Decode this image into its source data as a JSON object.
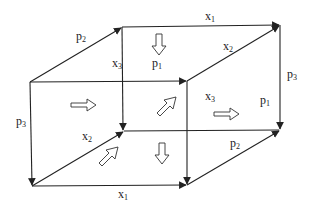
{
  "diagram": {
    "type": "cube-lattice",
    "colors": {
      "stroke": "#222222",
      "background": "#ffffff"
    },
    "vertices": {
      "back_top_left": [
        122,
        27
      ],
      "back_top_right": [
        280,
        25
      ],
      "front_top_left": [
        30,
        82
      ],
      "front_top_right": [
        187,
        81
      ],
      "back_bottom_left": [
        124,
        131
      ],
      "back_bottom_right": [
        280,
        130
      ],
      "front_bottom_left": [
        32,
        186
      ],
      "front_bottom_right": [
        187,
        185
      ]
    },
    "labels": [
      {
        "id": "p2_top",
        "base": "p",
        "sub": "2",
        "x": 76,
        "y": 30
      },
      {
        "id": "x1_top",
        "base": "x",
        "sub": "1",
        "x": 205,
        "y": 10
      },
      {
        "id": "x3_back",
        "base": "x",
        "sub": "3",
        "x": 112,
        "y": 57
      },
      {
        "id": "p1_top",
        "base": "p",
        "sub": "1",
        "x": 152,
        "y": 57
      },
      {
        "id": "x2_top",
        "base": "x",
        "sub": "2",
        "x": 223,
        "y": 40
      },
      {
        "id": "p3_right",
        "base": "p",
        "sub": "3",
        "x": 287,
        "y": 68
      },
      {
        "id": "p3_left",
        "base": "p",
        "sub": "3",
        "x": 16,
        "y": 115
      },
      {
        "id": "x2_mid",
        "base": "x",
        "sub": "2",
        "x": 82,
        "y": 130
      },
      {
        "id": "x3_mid",
        "base": "x",
        "sub": "3",
        "x": 205,
        "y": 90
      },
      {
        "id": "p1_right",
        "base": "p",
        "sub": "1",
        "x": 260,
        "y": 94
      },
      {
        "id": "p2_bottom",
        "base": "p",
        "sub": "2",
        "x": 230,
        "y": 137
      },
      {
        "id": "x1_bottom",
        "base": "x",
        "sub": "1",
        "x": 118,
        "y": 188
      }
    ]
  }
}
